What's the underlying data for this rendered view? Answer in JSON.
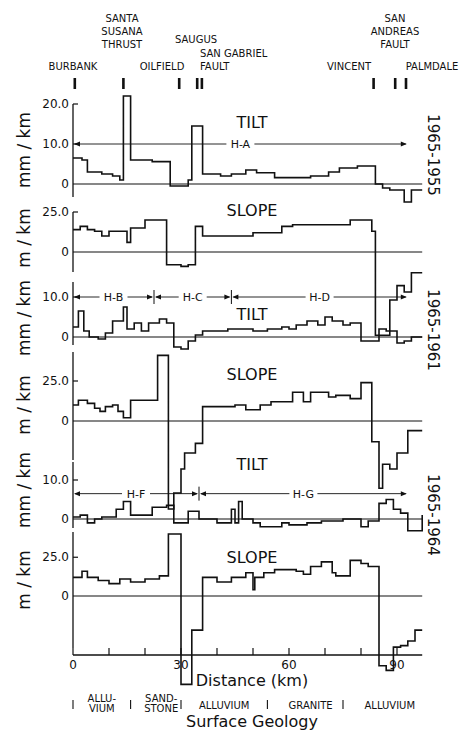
{
  "figure": {
    "xlabel": "Distance (km)",
    "geology_title": "Surface Geology",
    "x_ticks": [
      0,
      30,
      60,
      90
    ],
    "x_minor_ticks": [
      0,
      10,
      20,
      30,
      40,
      50,
      60,
      70,
      80,
      90
    ],
    "x_range": [
      0,
      97
    ],
    "locations": [
      {
        "name": "BURBANK",
        "lines": [
          "BURBANK"
        ],
        "km": 0.5
      },
      {
        "name": "SANTA SUSANA THRUST",
        "lines": [
          "SANTA",
          "SUSANA",
          "THRUST"
        ],
        "km": 14
      },
      {
        "name": "OILFIELD",
        "lines": [
          "OILFIELD"
        ],
        "km": 29.5
      },
      {
        "name": "SAUGUS",
        "lines": [
          "SAUGUS"
        ],
        "km": 34.5
      },
      {
        "name": "SAN GABRIEL FAULT",
        "lines": [
          "SAN GABRIEL",
          "FAULT"
        ],
        "km": 35.8
      },
      {
        "name": "VINCENT",
        "lines": [
          "VINCENT"
        ],
        "km": 83.5
      },
      {
        "name": "SAN ANDREAS FAULT",
        "lines": [
          "SAN",
          "ANDREAS",
          "FAULT"
        ],
        "km": 89.5
      },
      {
        "name": "PALMDALE",
        "lines": [
          "PALMDALE"
        ],
        "km": 92.5
      }
    ],
    "geology": [
      {
        "lines": [
          "ALLU-",
          "VIUM"
        ],
        "km_center": 8
      },
      {
        "lines": [
          "SAND-",
          "STONE"
        ],
        "km_center": 24.5
      },
      {
        "lines": [
          "ALLUVIUM"
        ],
        "km_center": 42
      },
      {
        "lines": [
          "GRANITE"
        ],
        "km_center": 66
      },
      {
        "lines": [
          "ALLUVIUM"
        ],
        "km_center": 88
      }
    ],
    "geology_dividers_km": [
      0,
      16,
      30,
      54,
      75
    ]
  },
  "chart_data": [
    {
      "type": "line",
      "step": true,
      "title": "TILT",
      "period": "1965-1955",
      "ylabel": "mm/km",
      "yticks": [
        0,
        10.0,
        20.0
      ],
      "ytick_labels": [
        "0",
        "10.0",
        "20.0"
      ],
      "ylim": [
        -4,
        21
      ],
      "segments": [
        {
          "label": "H-A",
          "from_km": 0,
          "to_km": 93,
          "y": 10.0
        }
      ],
      "x": [
        0,
        2.5,
        4,
        8,
        11,
        13,
        14,
        16,
        20,
        22,
        26,
        27,
        32,
        33,
        36,
        38,
        41,
        44,
        48,
        51,
        56,
        62,
        66,
        71,
        74,
        79,
        84,
        86,
        88,
        92,
        94,
        97
      ],
      "values": [
        6.5,
        6.0,
        3.0,
        2.5,
        2.0,
        1.0,
        22.0,
        6.0,
        6.0,
        5.6,
        5.6,
        -0.5,
        1.0,
        14.5,
        2.5,
        2.5,
        2.0,
        2.5,
        3.5,
        2.8,
        1.6,
        1.6,
        2.0,
        3.0,
        4.0,
        4.5,
        0.0,
        -1.0,
        -1.5,
        -4.5,
        -1.5,
        -1.5
      ]
    },
    {
      "type": "line",
      "step": true,
      "title": "SLOPE",
      "period": "1965-1955",
      "ylabel": "m/km",
      "yticks": [
        0,
        25.0
      ],
      "ytick_labels": [
        "0",
        "25.0"
      ],
      "ylim": [
        -55,
        28
      ],
      "x": [
        0,
        2,
        4,
        6,
        8,
        10,
        12,
        15,
        16,
        18,
        20,
        24,
        26,
        30,
        32,
        34,
        36,
        41,
        50,
        53,
        58,
        60,
        61,
        75,
        77,
        83,
        84,
        86,
        88,
        90,
        92,
        94,
        97
      ],
      "values": [
        14,
        16,
        14,
        13,
        10,
        13,
        13,
        6,
        15,
        15,
        20,
        20,
        -8,
        -9,
        -8,
        16,
        10,
        10,
        12,
        12,
        16,
        16,
        17,
        17,
        20,
        13,
        -52,
        -52,
        -30,
        -21,
        -25,
        -13,
        -13
      ]
    },
    {
      "type": "line",
      "step": true,
      "title": "TILT",
      "period": "1965-1961",
      "ylabel": "mm/km",
      "yticks": [
        0,
        10.0
      ],
      "ytick_labels": [
        "0",
        "10.0"
      ],
      "ylim": [
        -4,
        11
      ],
      "segments": [
        {
          "label": "H-B",
          "from_km": 0,
          "to_km": 22.5,
          "y": 10.0
        },
        {
          "label": "H-C",
          "from_km": 22.5,
          "to_km": 44,
          "y": 10.0
        },
        {
          "label": "H-D",
          "from_km": 44,
          "to_km": 93,
          "y": 10.0
        }
      ],
      "x": [
        0,
        1.5,
        3,
        4.5,
        7,
        9,
        11,
        14,
        15,
        17,
        19,
        21,
        24,
        26,
        28,
        30,
        32,
        34,
        36,
        39,
        43,
        48,
        50,
        54,
        58,
        60,
        62,
        65,
        68,
        70,
        72,
        75,
        77,
        80,
        85,
        87,
        90,
        92,
        94,
        97
      ],
      "values": [
        2.5,
        6.5,
        1.5,
        0.0,
        -0.5,
        1.0,
        4.0,
        7.5,
        2.0,
        3.5,
        1.5,
        3.5,
        4.5,
        3.5,
        -2.5,
        -3.0,
        -1.0,
        0.5,
        1.5,
        1.5,
        2.0,
        2.0,
        1.5,
        2.0,
        2.5,
        2.0,
        3.0,
        4.0,
        3.0,
        5.0,
        4.0,
        3.0,
        3.5,
        -1.0,
        2.0,
        1.5,
        -1.5,
        -1.0,
        0.0,
        0.0
      ]
    },
    {
      "type": "line",
      "step": true,
      "title": "SLOPE",
      "period": "1965-1961",
      "ylabel": "m/km",
      "yticks": [
        0,
        25.0
      ],
      "ytick_labels": [
        "0",
        "25.0"
      ],
      "ylim": [
        -55,
        45
      ],
      "x": [
        0,
        1.5,
        4,
        6,
        7.5,
        9,
        11,
        12.5,
        14,
        16,
        22,
        23.5,
        26.5,
        28,
        30,
        31,
        34,
        36,
        45,
        48,
        52,
        55,
        61,
        64,
        66,
        71,
        73,
        77,
        80,
        83,
        85,
        86,
        88,
        90,
        93,
        97
      ],
      "values": [
        10,
        13,
        11,
        8,
        6,
        9,
        10,
        6,
        2,
        13,
        13,
        41,
        -55,
        -45,
        -30,
        -20,
        -14,
        9,
        10,
        7,
        10,
        12,
        18,
        12,
        18,
        15,
        16,
        14,
        24,
        -13,
        -42,
        -27,
        -30,
        -20,
        -6,
        -6
      ]
    },
    {
      "type": "line",
      "step": true,
      "title": "TILT",
      "period": "1965-1964",
      "ylabel": "mm/km",
      "yticks": [
        0,
        10.0
      ],
      "ytick_labels": [
        "0",
        "10.0"
      ],
      "ylim": [
        -3,
        11
      ],
      "segments": [
        {
          "label": "H-F",
          "from_km": 0,
          "to_km": 35,
          "y": 6.5
        },
        {
          "label": "H-G",
          "from_km": 35,
          "to_km": 93,
          "y": 6.5
        }
      ],
      "x": [
        0,
        2,
        4,
        6,
        8,
        12,
        14,
        16,
        18,
        22,
        26,
        28,
        32,
        35,
        40,
        44,
        45,
        46,
        47,
        50,
        52,
        56,
        58,
        60,
        65,
        69,
        75,
        80,
        82,
        85,
        87,
        89,
        91,
        93,
        97
      ],
      "values": [
        0.5,
        1.0,
        -1.0,
        0.0,
        0.5,
        2.5,
        4.5,
        1.0,
        1.0,
        3.0,
        3.5,
        -1.0,
        2.0,
        0.0,
        -1.0,
        2.5,
        -1.0,
        4.5,
        0.0,
        -1.0,
        -2.0,
        -2.0,
        -1.0,
        -1.5,
        -1.0,
        -0.5,
        0.0,
        -2.0,
        -0.5,
        4.0,
        5.0,
        2.5,
        1.5,
        -3.0,
        1.0
      ]
    },
    {
      "type": "line",
      "step": true,
      "title": "SLOPE",
      "period": "1965-1964",
      "ylabel": "m/km",
      "yticks": [
        0,
        25.0
      ],
      "ytick_labels": [
        "0",
        "25.0"
      ],
      "ylim": [
        -60,
        45
      ],
      "x": [
        0,
        2.5,
        4,
        7,
        10,
        13,
        16,
        20,
        24,
        26.5,
        30,
        33,
        36,
        40,
        44,
        48,
        50,
        50.5,
        53,
        56,
        58,
        62,
        64,
        66,
        69,
        72,
        73,
        77,
        80,
        82,
        85,
        87,
        89,
        91,
        93,
        95,
        97
      ],
      "values": [
        12,
        16,
        12,
        10,
        8,
        11,
        9,
        11,
        13,
        40,
        -57,
        -22,
        12,
        9,
        12,
        15,
        4,
        12,
        15,
        17,
        17,
        16,
        14,
        19,
        22,
        15,
        13,
        23,
        21,
        19,
        -45,
        -48,
        -33,
        -32,
        -29,
        -22,
        -22
      ]
    }
  ]
}
